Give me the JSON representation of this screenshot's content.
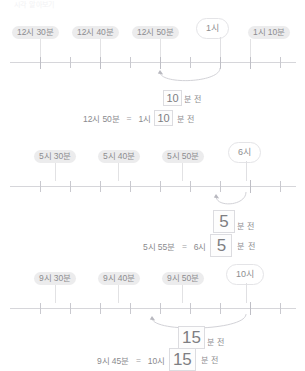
{
  "header": {
    "cropped_text": "시각 알아보기"
  },
  "problems": [
    {
      "id": "problem-1",
      "pills": [
        {
          "label": "12시 30분",
          "left": 12,
          "tick_x": 40
        },
        {
          "label": "12시 40분",
          "left": 72,
          "tick_x": 100
        },
        {
          "label": "12시 50분",
          "left": 132,
          "tick_x": 160
        },
        {
          "label": "1시 10분",
          "left": 248,
          "tick_x": 250
        }
      ],
      "bubble": {
        "label": "1시",
        "left": 196,
        "tick_x": 220
      },
      "arrow": {
        "from_x": 220,
        "to_x": 160,
        "depth": 11
      },
      "answer": {
        "value": "10",
        "unit": "분 전",
        "size": "small",
        "left": 163,
        "top": 76
      },
      "equation": {
        "left": 82,
        "top": 96,
        "left_term": "12시 50분",
        "sign": "=",
        "hour_term": "1시",
        "value": "10",
        "unit": "분 전",
        "size": "small"
      }
    },
    {
      "id": "problem-2",
      "pills": [
        {
          "label": "5시 30분",
          "left": 34,
          "tick_x": 55
        },
        {
          "label": "5시 40분",
          "left": 98,
          "tick_x": 118
        },
        {
          "label": "5시 50분",
          "left": 162,
          "tick_x": 182
        },
        {
          "label": "",
          "left": 0,
          "tick_x": 0
        }
      ],
      "bubble": {
        "label": "6시",
        "left": 228,
        "tick_x": 246
      },
      "arrow": {
        "from_x": 246,
        "to_x": 216,
        "depth": 10
      },
      "answer": {
        "value": "5",
        "unit": "분 전",
        "size": "big",
        "left": 213,
        "top": 72
      },
      "equation": {
        "left": 142,
        "top": 96,
        "left_term": "5시 55분",
        "sign": "=",
        "hour_term": "6시",
        "value": "5",
        "unit": "분 전",
        "size": "big"
      }
    },
    {
      "id": "problem-3",
      "pills": [
        {
          "label": "9시 30분",
          "left": 34,
          "tick_x": 55
        },
        {
          "label": "9시 40분",
          "left": 98,
          "tick_x": 118
        },
        {
          "label": "9시 50분",
          "left": 162,
          "tick_x": 182
        },
        {
          "label": "",
          "left": 0,
          "tick_x": 0
        }
      ],
      "bubble": {
        "label": "10시",
        "left": 226,
        "tick_x": 246
      },
      "arrow": {
        "from_x": 246,
        "to_x": 152,
        "depth": 13
      },
      "answer": {
        "value": "15",
        "unit": "분 전",
        "size": "big",
        "left": 178,
        "top": 66
      },
      "equation": {
        "left": 96,
        "top": 88,
        "left_term": "9시 45분",
        "sign": "=",
        "hour_term": "10시",
        "value": "15",
        "unit": "분 전",
        "size": "big"
      }
    }
  ],
  "ticks": {
    "count": 9,
    "start_x": 40,
    "spacing": 30
  }
}
